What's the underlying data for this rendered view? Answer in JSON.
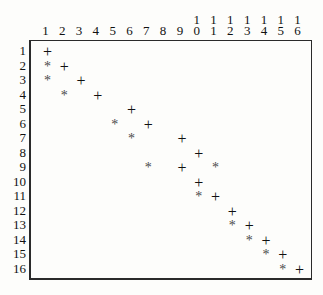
{
  "chart_data": {
    "type": "scatter",
    "title": "",
    "xlabel": "",
    "ylabel": "",
    "grid": false,
    "legend": null,
    "x_axis_position": "top",
    "y_axis_position": "left",
    "xlim": [
      1,
      16
    ],
    "ylim": [
      1,
      16
    ],
    "x_tick_labels": [
      "1",
      "2",
      "3",
      "4",
      "5",
      "6",
      "7",
      "8",
      "9",
      "10",
      "11",
      "12",
      "13",
      "14",
      "15",
      "16"
    ],
    "y_tick_labels": [
      "1",
      "2",
      "3",
      "4",
      "5",
      "6",
      "7",
      "8",
      "9",
      "10",
      "11",
      "12",
      "13",
      "14",
      "15",
      "16"
    ],
    "x_tick_labels_stacked": [
      {
        "hi": "",
        "lo": "1"
      },
      {
        "hi": "",
        "lo": "2"
      },
      {
        "hi": "",
        "lo": "3"
      },
      {
        "hi": "",
        "lo": "4"
      },
      {
        "hi": "",
        "lo": "5"
      },
      {
        "hi": "",
        "lo": "6"
      },
      {
        "hi": "",
        "lo": "7"
      },
      {
        "hi": "",
        "lo": "8"
      },
      {
        "hi": "",
        "lo": "9"
      },
      {
        "hi": "1",
        "lo": "0"
      },
      {
        "hi": "1",
        "lo": "1"
      },
      {
        "hi": "1",
        "lo": "2"
      },
      {
        "hi": "1",
        "lo": "3"
      },
      {
        "hi": "1",
        "lo": "4"
      },
      {
        "hi": "1",
        "lo": "5"
      },
      {
        "hi": "1",
        "lo": "6"
      }
    ],
    "series": [
      {
        "name": "plus",
        "marker": "+",
        "points": [
          {
            "x": 1,
            "y": 1
          },
          {
            "x": 2,
            "y": 2
          },
          {
            "x": 3,
            "y": 3
          },
          {
            "x": 4,
            "y": 4
          },
          {
            "x": 6,
            "y": 5
          },
          {
            "x": 7,
            "y": 6
          },
          {
            "x": 9,
            "y": 7
          },
          {
            "x": 10,
            "y": 8
          },
          {
            "x": 9,
            "y": 9
          },
          {
            "x": 10,
            "y": 10
          },
          {
            "x": 11,
            "y": 11
          },
          {
            "x": 12,
            "y": 12
          },
          {
            "x": 13,
            "y": 13
          },
          {
            "x": 14,
            "y": 14
          },
          {
            "x": 15,
            "y": 15
          },
          {
            "x": 16,
            "y": 16
          }
        ]
      },
      {
        "name": "star",
        "marker": "*",
        "points": [
          {
            "x": 1,
            "y": 2
          },
          {
            "x": 1,
            "y": 3
          },
          {
            "x": 2,
            "y": 4
          },
          {
            "x": 5,
            "y": 6
          },
          {
            "x": 6,
            "y": 7
          },
          {
            "x": 7,
            "y": 9
          },
          {
            "x": 11,
            "y": 9
          },
          {
            "x": 10,
            "y": 11
          },
          {
            "x": 12,
            "y": 13
          },
          {
            "x": 13,
            "y": 14
          },
          {
            "x": 14,
            "y": 15
          },
          {
            "x": 15,
            "y": 16
          }
        ]
      }
    ]
  }
}
